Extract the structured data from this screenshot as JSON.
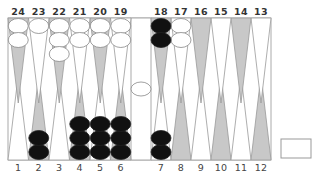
{
  "game": "backgammon",
  "colors": {
    "board_bg": "#ffffff",
    "border": "#aaaaaa",
    "point_dark": "#c8c8c8",
    "point_light": "#ffffff",
    "checker_black": "#111111",
    "checker_white": "#ffffff",
    "checker_outline": "#888888"
  },
  "top_labels": [
    "24",
    "23",
    "22",
    "21",
    "20",
    "19",
    "18",
    "17",
    "16",
    "15",
    "14",
    "13"
  ],
  "bottom_labels": [
    "1",
    "2",
    "3",
    "4",
    "5",
    "6",
    "7",
    "8",
    "9",
    "10",
    "11",
    "12"
  ],
  "points": {
    "1": {
      "color": "",
      "count": 0
    },
    "2": {
      "color": "black",
      "count": 2
    },
    "3": {
      "color": "",
      "count": 0
    },
    "4": {
      "color": "black",
      "count": 3
    },
    "5": {
      "color": "black",
      "count": 3
    },
    "6": {
      "color": "black",
      "count": 3
    },
    "7": {
      "color": "black",
      "count": 2
    },
    "8": {
      "color": "",
      "count": 0
    },
    "9": {
      "color": "",
      "count": 0
    },
    "10": {
      "color": "",
      "count": 0
    },
    "11": {
      "color": "",
      "count": 0
    },
    "12": {
      "color": "",
      "count": 0
    },
    "13": {
      "color": "",
      "count": 0
    },
    "14": {
      "color": "",
      "count": 0
    },
    "15": {
      "color": "",
      "count": 0
    },
    "16": {
      "color": "",
      "count": 0
    },
    "17": {
      "color": "white",
      "count": 2
    },
    "18": {
      "color": "black",
      "count": 2
    },
    "19": {
      "color": "white",
      "count": 2
    },
    "20": {
      "color": "white",
      "count": 2
    },
    "21": {
      "color": "white",
      "count": 2
    },
    "22": {
      "color": "white",
      "count": 3
    },
    "23": {
      "color": "white",
      "count": 1
    },
    "24": {
      "color": "white",
      "count": 2
    }
  },
  "bar": {
    "white": 1,
    "black": 0
  },
  "cube_box": {
    "value": ""
  }
}
